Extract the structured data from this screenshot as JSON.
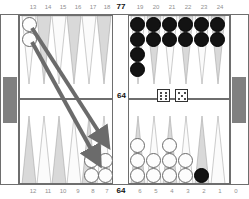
{
  "board": {
    "game": "backgammon",
    "top_labels": [
      "13",
      "14",
      "15",
      "16",
      "17",
      "18",
      "19",
      "20",
      "21",
      "22",
      "23",
      "24"
    ],
    "bottom_labels": [
      "12",
      "11",
      "10",
      "9",
      "8",
      "7",
      "6",
      "5",
      "4",
      "3",
      "2",
      "1"
    ],
    "bear_off_label": "0",
    "pip_count_top": "77",
    "pip_count_bottom": "64",
    "bar_label": "64",
    "colors": {
      "black_checker": "#131313",
      "white_checker": "#fdfdfd",
      "point_dark": "#d7d7d7",
      "point_light": "#fbfbfb",
      "frame": "#6e6e6e",
      "tray": "#808080",
      "arrow": "#6b6b6b",
      "label": "#909090"
    }
  },
  "dice": [
    {
      "name": "die-left",
      "value": "6",
      "pips": 6
    },
    {
      "name": "die-right",
      "value": "5",
      "pips": 5
    }
  ],
  "points": [
    {
      "point": "13",
      "color": "white",
      "count": 2
    },
    {
      "point": "19",
      "color": "black",
      "count": 4
    },
    {
      "point": "20",
      "color": "black",
      "count": 2
    },
    {
      "point": "21",
      "color": "black",
      "count": 2
    },
    {
      "point": "22",
      "color": "black",
      "count": 2
    },
    {
      "point": "23",
      "color": "black",
      "count": 2
    },
    {
      "point": "24",
      "color": "black",
      "count": 2
    },
    {
      "point": "8",
      "color": "white",
      "count": 2
    },
    {
      "point": "7",
      "color": "white",
      "count": 2
    },
    {
      "point": "6",
      "color": "white",
      "count": 3
    },
    {
      "point": "5",
      "color": "white",
      "count": 2
    },
    {
      "point": "4",
      "color": "white",
      "count": 3
    },
    {
      "point": "3",
      "color": "white",
      "count": 2
    },
    {
      "point": "2",
      "color": "black",
      "count": 1
    }
  ],
  "moves": [
    {
      "name": "move-arrow-13-to-8",
      "from": "13",
      "to": "8"
    },
    {
      "name": "move-arrow-13-to-7",
      "from": "13",
      "to": "7"
    }
  ]
}
